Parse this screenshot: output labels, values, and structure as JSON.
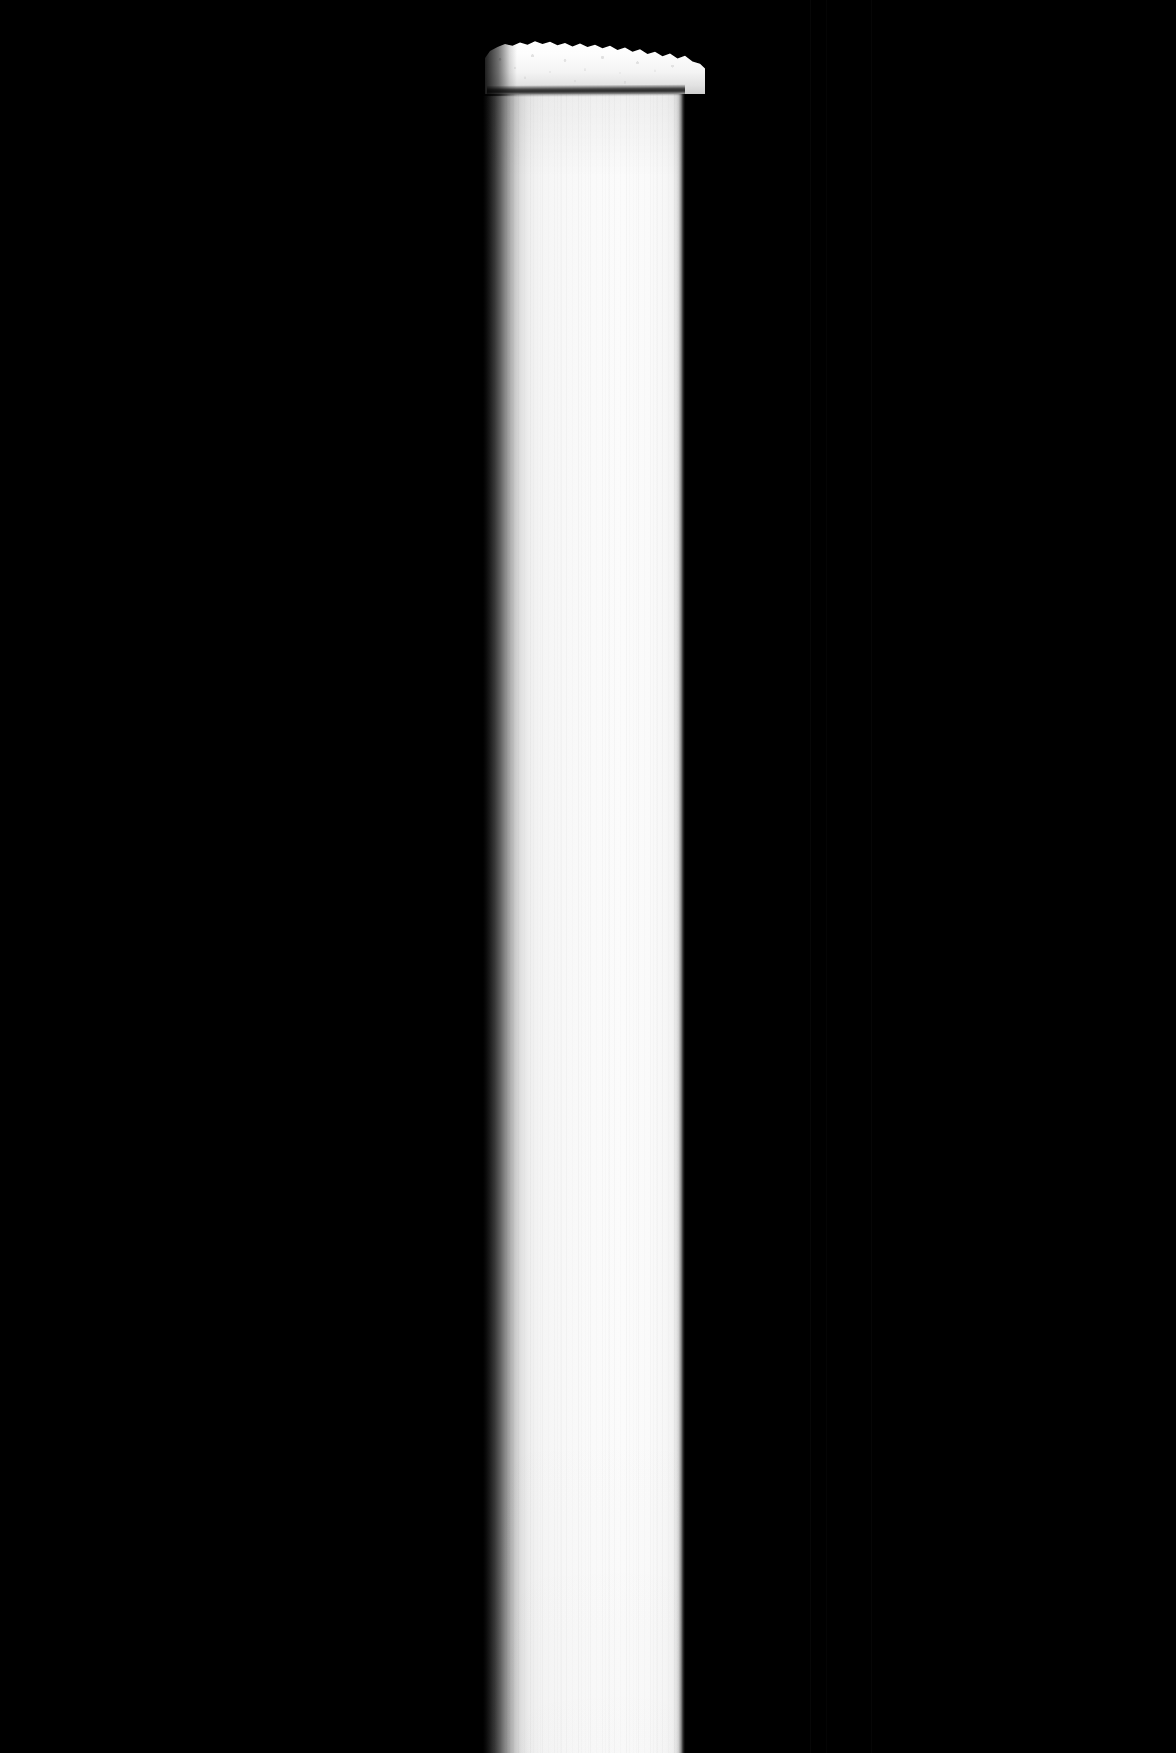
{
  "image": {
    "title": "Grayscale vertical column with textured cap",
    "width": 1176,
    "height": 1753,
    "orientation": "portrait",
    "color_mode": "grayscale"
  },
  "palette": {
    "background": "#000000",
    "column_core": "#fbfbfb",
    "column_highlight": "#ffffff",
    "column_left_falloff": "#3a3a3a",
    "column_right_edge": "#2e2e2e",
    "cap_white": "#ffffff",
    "cap_shadow": "#cfcfcf",
    "dark_band": "#1a1a1a",
    "seam_artifact": "#070707"
  },
  "subject": {
    "name": "vertical-column",
    "description": "Tall bright white cylindrical column running from the upper area to the bottom edge of the frame, set against a pure black field.",
    "left_px": 483,
    "right_px": 685,
    "width_px": 202,
    "top_px": 88,
    "bottom_px": 1753,
    "height_px": 1665,
    "surface": "fine vertical striations",
    "left_edge_falloff_px": 38,
    "right_edge_falloff_px": 8
  },
  "cap": {
    "name": "textured-cap",
    "description": "Ragged, noisy, foam-like white deposit resting on top of the column; upper silhouette is irregular and slopes downward from left to right.",
    "left_px": 455,
    "right_px": 705,
    "top_px": 36,
    "bottom_px": 94,
    "height_px": 58,
    "texture": "granular speckle",
    "edge": "feathered"
  },
  "dark_band": {
    "name": "dark-separation-band",
    "description": "Narrow dark horizontal band separating the textured cap from the smooth column below.",
    "left_px": 487,
    "right_px": 685,
    "top_px": 86,
    "height_px": 11,
    "tilt_deg": -0.35
  },
  "artifacts": {
    "name": "seam-lines",
    "description": "Barely visible vertical seam lines within the black background.",
    "x_positions": [
      810,
      826,
      871
    ]
  }
}
